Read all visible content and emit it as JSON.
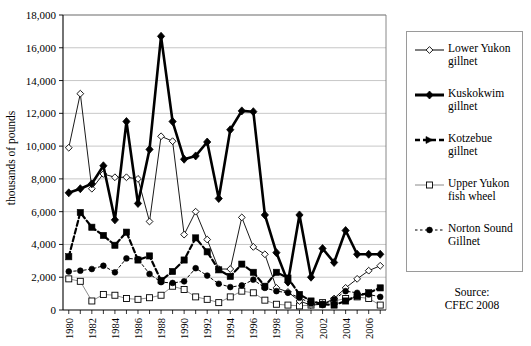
{
  "axis": {
    "ylabel": "thousands of pounds",
    "yticks": [
      "0",
      "2,000",
      "4,000",
      "6,000",
      "8,000",
      "10,000",
      "12,000",
      "14,000",
      "16,000",
      "18,000"
    ],
    "xticks": [
      "1980",
      "1982",
      "1984",
      "1986",
      "1988",
      "1990",
      "1992",
      "1994",
      "1996",
      "1998",
      "2000",
      "2002",
      "2004",
      "2006"
    ]
  },
  "legend": {
    "items": [
      {
        "label_line1": "Lower Yukon",
        "label_line2": "gillnet",
        "key": "lower_yukon_gillnet"
      },
      {
        "label_line1": "Kuskokwim",
        "label_line2": "gillnet",
        "key": "kuskokwim_gillnet"
      },
      {
        "label_line1": "Kotzebue",
        "label_line2": "gillnet",
        "key": "kotzebue_gillnet"
      },
      {
        "label_line1": "Upper Yukon",
        "label_line2": "fish wheel",
        "key": "upper_yukon_fish_wheel"
      },
      {
        "label_line1": "Norton Sound",
        "label_line2": "Gillnet",
        "key": "norton_sound_gillnet"
      }
    ]
  },
  "source": {
    "line1": "Source:",
    "line2": "CFEC 2008"
  },
  "chart_data": {
    "type": "line",
    "title": "",
    "xlabel": "",
    "ylabel": "thousands of pounds",
    "ylim": [
      0,
      18000
    ],
    "ytick_step": 2000,
    "grid": true,
    "legend_position": "right",
    "x": [
      1980,
      1981,
      1982,
      1983,
      1984,
      1985,
      1986,
      1987,
      1988,
      1989,
      1990,
      1991,
      1992,
      1993,
      1994,
      1995,
      1996,
      1997,
      1998,
      1999,
      2000,
      2001,
      2002,
      2003,
      2004,
      2005,
      2006,
      2007
    ],
    "series": [
      {
        "name": "Lower Yukon gillnet",
        "color": "#000000",
        "line_width": 0.9,
        "line_style": "solid",
        "marker": "open-diamond",
        "values": [
          9900,
          13200,
          7400,
          8300,
          8100,
          8100,
          8000,
          5400,
          10600,
          10300,
          4600,
          6000,
          4300,
          2500,
          2500,
          5650,
          3850,
          3400,
          1350,
          1100,
          550,
          300,
          350,
          700,
          1350,
          1900,
          2400,
          2700
        ]
      },
      {
        "name": "Kuskokwim gillnet",
        "color": "#000000",
        "line_width": 2.6,
        "line_style": "solid",
        "marker": "filled-diamond",
        "values": [
          7150,
          7400,
          7700,
          8800,
          5500,
          11500,
          6500,
          9800,
          16700,
          11500,
          9200,
          9400,
          10250,
          6800,
          11000,
          12150,
          12100,
          5800,
          3500,
          1700,
          5800,
          2000,
          3750,
          2900,
          4850,
          3400,
          3400,
          3400
        ]
      },
      {
        "name": "Kotzebue gillnet",
        "color": "#000000",
        "line_width": 2.2,
        "line_style": "dashed",
        "marker": "filled-square",
        "values": [
          3250,
          5950,
          5050,
          4550,
          3950,
          4750,
          3050,
          3300,
          1800,
          2350,
          3050,
          4400,
          3550,
          2450,
          2050,
          2800,
          2300,
          1450,
          2300,
          1950,
          950,
          550,
          350,
          300,
          550,
          850,
          1050,
          1350
        ]
      },
      {
        "name": "Upper Yukon fish wheel",
        "color": "#808080",
        "line_width": 0.9,
        "line_style": "solid",
        "marker": "open-square",
        "values": [
          1900,
          1750,
          550,
          950,
          900,
          700,
          650,
          750,
          900,
          1450,
          1250,
          800,
          650,
          450,
          800,
          1150,
          1050,
          600,
          350,
          300,
          250,
          300,
          450,
          550,
          700,
          800,
          700,
          300
        ]
      },
      {
        "name": "Norton Sound Gillnet",
        "color": "#000000",
        "line_width": 1.0,
        "line_style": "dotted",
        "marker": "filled-circle",
        "values": [
          2350,
          2400,
          2500,
          2700,
          2300,
          3150,
          3100,
          2200,
          1700,
          1650,
          1750,
          2550,
          2100,
          1600,
          1400,
          1500,
          1850,
          1350,
          1150,
          1050,
          750,
          400,
          300,
          650,
          1150,
          1050,
          950,
          800
        ]
      }
    ]
  }
}
